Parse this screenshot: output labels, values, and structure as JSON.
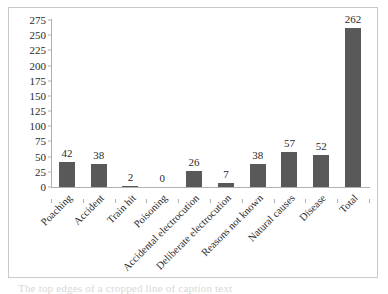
{
  "chart_data": {
    "type": "bar",
    "title": "",
    "subtitle": "",
    "xlabel": "",
    "ylabel": "",
    "ylim": [
      0,
      275
    ],
    "ytick_step": 25,
    "yticks": [
      275,
      250,
      225,
      200,
      175,
      150,
      125,
      100,
      75,
      50,
      25,
      0
    ],
    "grid": false,
    "legend": null,
    "bar_color": "#595959",
    "axis_color": "#b0b0b0",
    "text_color": "#2b2b2b",
    "border_color": "#c9c9c9",
    "categories": [
      "Poaching",
      "Accident",
      "Train hit",
      "Poisoning",
      "Accidental electrocution",
      "Deliberate electrocution",
      "Reasons not known",
      "Natural causes",
      "Disease",
      "Total"
    ],
    "values": [
      42,
      38,
      2,
      0,
      26,
      7,
      38,
      57,
      52,
      262
    ],
    "value_labels": [
      "42",
      "38",
      "2",
      "0",
      "26",
      "7",
      "38",
      "57",
      "52",
      "262"
    ]
  },
  "caption": {
    "cropped_text": "The top edges of a cropped line of caption text"
  }
}
